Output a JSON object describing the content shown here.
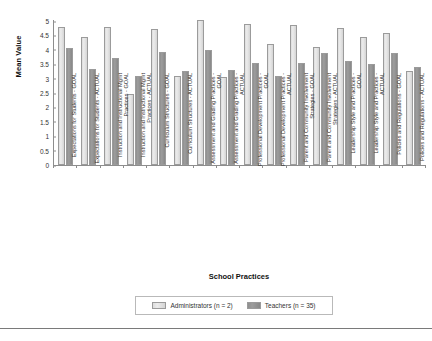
{
  "chart_data": {
    "type": "bar",
    "title": "",
    "xlabel": "School Practices",
    "ylabel": "Mean Value",
    "ylim": [
      0,
      5
    ],
    "ytick_labels": [
      "5",
      "4.5",
      "4",
      "3.5",
      "3",
      "2.5",
      "2",
      "1.5",
      "1",
      "0.5",
      "0"
    ],
    "ytick_values": [
      5,
      4.5,
      4,
      3.5,
      3,
      2.5,
      2,
      1.5,
      1,
      0.5,
      0
    ],
    "grid": false,
    "legend_position": "bottom",
    "categories": [
      "Expectations for Students - GOAL",
      "Expectations for Students - ACTUAL",
      "Instruction and Instructional Mgmt Practices - GOAL",
      "Instruction and Instructional Mgmt Practices - ACTUAL",
      "Curriculum Structures - GOAL",
      "Curriculum Structures - ACTUAL",
      "Assessment and Grading Practices - GOAL",
      "Assessment and Grading Practices - ACTUAL",
      "Professional Development Practices - GOAL",
      "Professional Development Practices - ACTUAL",
      "Parent and Community Involvement Strategies - GOAL",
      "Parent and Community Involvement Strategies - ACTUAL",
      "Leadership Style and Practices - GOAL",
      "Leadership Style and Practices - ACTUAL",
      "Policies and Regulations - GOAL",
      "Policies and Regulations - ACTUAL"
    ],
    "series": [
      {
        "name": "Administrators (n = 2)",
        "color": "#e0e0e0",
        "values": [
          4.8,
          4.45,
          4.8,
          2.45,
          4.72,
          3.1,
          5.05,
          3.05,
          4.9,
          4.2,
          4.85,
          4.1,
          4.75,
          4.45,
          4.6,
          3.25
        ]
      },
      {
        "name": "Teachers (n = 35)",
        "color": "#919191",
        "values": [
          4.07,
          3.35,
          3.72,
          3.1,
          3.93,
          3.28,
          4.0,
          3.3,
          3.55,
          3.1,
          3.55,
          3.9,
          3.6,
          3.5,
          3.9,
          3.4
        ]
      }
    ]
  },
  "axes": {
    "y_title": "Mean Value",
    "x_title": "School Practices"
  },
  "legend": {
    "items": [
      {
        "label": "Administrators (n = 2)",
        "swatch": "admin"
      },
      {
        "label": "Teachers (n = 35)",
        "swatch": "teach"
      }
    ]
  }
}
